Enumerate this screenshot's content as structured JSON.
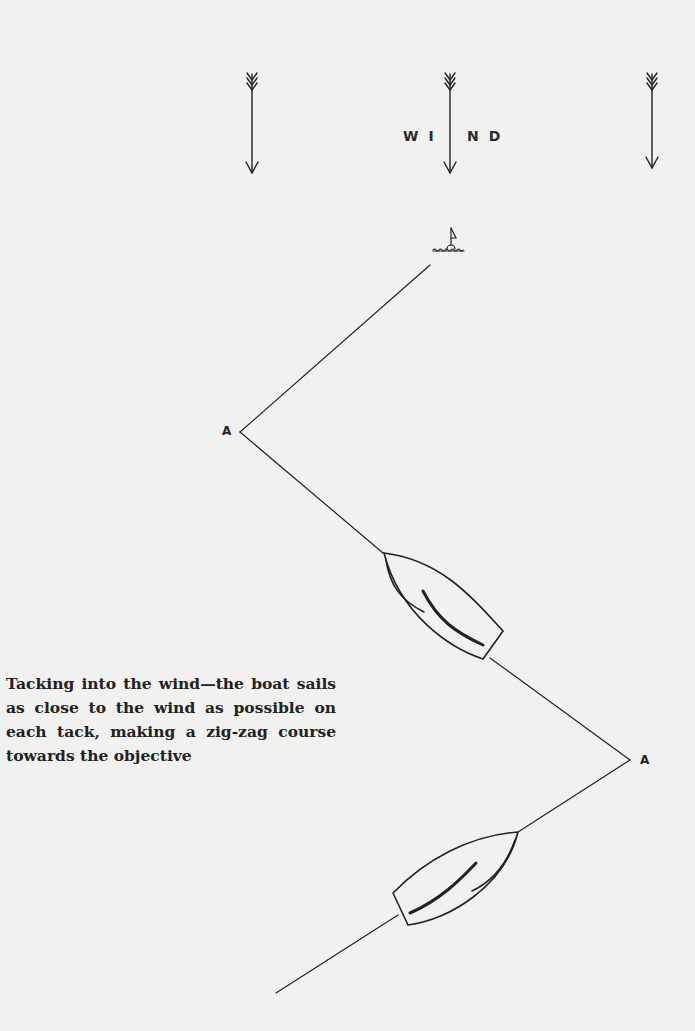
{
  "diagram": {
    "title_letters_left": "WI",
    "title_letters_right": "ND",
    "title_full": "WIND",
    "wind_arrows": [
      {
        "name": "wind-arrow-left",
        "x": 252,
        "top": 72,
        "bottom": 175
      },
      {
        "name": "wind-arrow-center",
        "x": 450,
        "top": 72,
        "bottom": 175
      },
      {
        "name": "wind-arrow-right",
        "x": 652,
        "top": 72,
        "bottom": 170
      }
    ],
    "mark": {
      "label": "buoy-mark",
      "x": 452,
      "y": 248
    },
    "tack_points": [
      {
        "label": "A",
        "x": 240,
        "y": 432
      },
      {
        "label": "A",
        "x": 630,
        "y": 760
      }
    ],
    "course_path": [
      [
        276,
        993
      ],
      [
        630,
        760
      ],
      [
        240,
        432
      ],
      [
        430,
        265
      ]
    ],
    "boats": [
      {
        "name": "boat-upper",
        "heading": "port tack"
      },
      {
        "name": "boat-lower",
        "heading": "starboard tack"
      }
    ],
    "caption": "Tacking into the wind—the boat sails as close to the wind as possible on each tack, making a zig-zag course towards the objective",
    "colors": {
      "paper": "#f1f1ef",
      "ink": "#222222"
    }
  }
}
